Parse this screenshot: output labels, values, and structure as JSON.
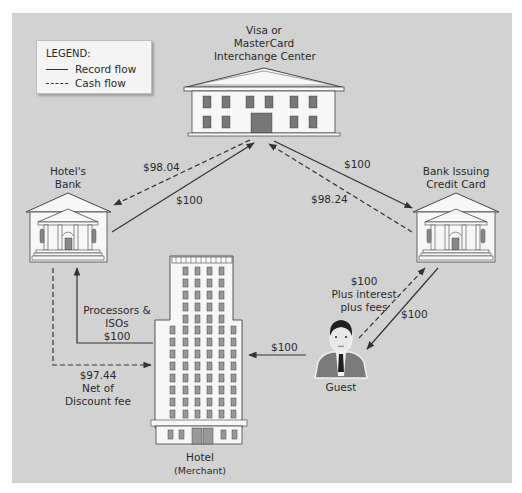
{
  "legend": {
    "title": "LEGEND:",
    "items": [
      {
        "label": "Record flow",
        "style": "solid"
      },
      {
        "label": "Cash flow",
        "style": "dashed"
      }
    ]
  },
  "nodes": {
    "interchange": {
      "line1": "Visa or",
      "line2": "MasterCard",
      "line3": "Interchange Center",
      "icon": "government-building-icon"
    },
    "hotels_bank": {
      "line1": "Hotel's",
      "line2": "Bank",
      "icon": "bank-icon"
    },
    "issuing_bank": {
      "line1": "Bank Issuing",
      "line2": "Credit Card",
      "icon": "bank-icon"
    },
    "hotel": {
      "line1": "Hotel",
      "line2": "(Merchant)",
      "icon": "skyscraper-icon"
    },
    "guest": {
      "line1": "Guest",
      "icon": "person-icon"
    }
  },
  "flows": {
    "bank_to_interchange_cash": "$98.04",
    "hotelsbank_to_interchange_record": "$100",
    "interchange_to_issuer_record": "$100",
    "issuer_to_interchange_cash": "$98.24",
    "processors": {
      "line1": "Processors &",
      "line2": "ISOs",
      "line3": "$100"
    },
    "net_discount": {
      "line1": "$97.44",
      "line2": "Net of",
      "line3": "Discount fee"
    },
    "guest_to_hotel": "$100",
    "guest_to_issuer": {
      "line1": "$100",
      "line2": "Plus interest",
      "line3": "plus fees"
    },
    "issuer_to_guest": "$100"
  },
  "colors": {
    "panel": "#d2d2d2",
    "line": "#333333",
    "building_fill": "#f7f7f7",
    "window": "#8a8a8a"
  }
}
